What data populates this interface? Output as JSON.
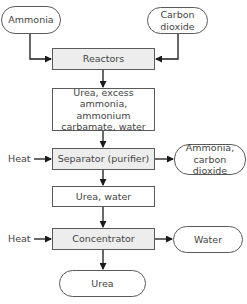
{
  "diagram": {
    "type": "flowchart",
    "colors": {
      "stroke": "#1a1a1a",
      "box_border": "#5a5a5a",
      "process_fill": "#ededed",
      "text": "#444444"
    },
    "inputs": {
      "ammonia": "Ammonia",
      "carbon_dioxide_line1": "Carbon",
      "carbon_dioxide_line2": "dioxide"
    },
    "nodes": {
      "reactors": "Reactors",
      "mixture_line1": "Urea, excess",
      "mixture_line2": "ammonia, ammonium",
      "mixture_line3": "carbamate, water",
      "separator": "Separator (purifier)",
      "urea_water": "Urea, water",
      "concentrator": "Concentrator",
      "urea": "Urea"
    },
    "side_inputs": {
      "heat_separator": "Heat",
      "heat_concentrator": "Heat"
    },
    "outputs": {
      "recycled_line1": "Ammonia,",
      "recycled_line2": "carbon dioxide",
      "water": "Water"
    },
    "edges": [
      {
        "from": "Ammonia",
        "to": "Reactors"
      },
      {
        "from": "Carbon dioxide",
        "to": "Reactors"
      },
      {
        "from": "Reactors",
        "to": "Urea, excess ammonia, ammonium carbamate, water"
      },
      {
        "from": "Urea, excess ammonia, ammonium carbamate, water",
        "to": "Separator (purifier)"
      },
      {
        "from": "Heat",
        "to": "Separator (purifier)"
      },
      {
        "from": "Separator (purifier)",
        "to": "Ammonia, carbon dioxide"
      },
      {
        "from": "Separator (purifier)",
        "to": "Urea, water"
      },
      {
        "from": "Urea, water",
        "to": "Concentrator"
      },
      {
        "from": "Heat",
        "to": "Concentrator"
      },
      {
        "from": "Concentrator",
        "to": "Water"
      },
      {
        "from": "Concentrator",
        "to": "Urea"
      }
    ]
  }
}
